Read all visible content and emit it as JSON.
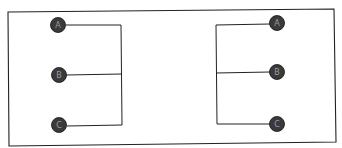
{
  "diagram": {
    "type": "hand-drawn wiring sketch",
    "colors": {
      "line": "#222222",
      "node_fill": "#3a3a3a",
      "node_label": "#9a9a9a",
      "background": "#ffffff"
    },
    "left_group": {
      "nodes": [
        {
          "label": "A"
        },
        {
          "label": "B"
        },
        {
          "label": "C"
        }
      ],
      "bus_side": "right"
    },
    "right_group": {
      "nodes": [
        {
          "label": "A"
        },
        {
          "label": "B"
        },
        {
          "label": "C"
        }
      ],
      "bus_side": "left"
    }
  }
}
